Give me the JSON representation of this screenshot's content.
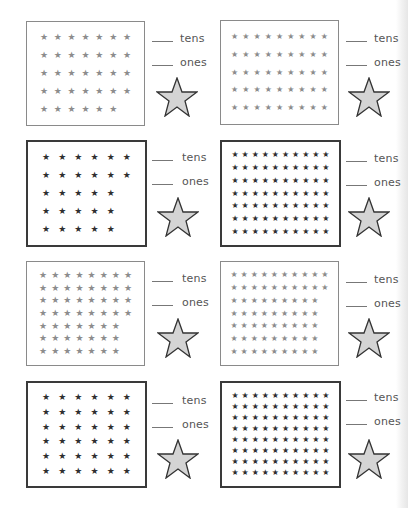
{
  "worksheet": {
    "labels": {
      "tens": "tens",
      "ones": "ones"
    },
    "star_glyph": "★",
    "colors": {
      "light_border": "#8a8a8a",
      "dark_border": "#3a3a3a",
      "light_star": "#8c8c8c",
      "dark_star": "#2e2e2e",
      "answer_star_fill": "#d4d4d4",
      "answer_star_stroke": "#333333"
    },
    "problems": [
      {
        "id": 1,
        "style": "light",
        "rows": [
          7,
          7,
          7,
          7,
          6
        ],
        "total": 34
      },
      {
        "id": 2,
        "style": "light",
        "rows": [
          9,
          9,
          9,
          9,
          9
        ],
        "total": 45
      },
      {
        "id": 3,
        "style": "dark",
        "rows": [
          6,
          6,
          5,
          5,
          5
        ],
        "total": 27
      },
      {
        "id": 4,
        "style": "dark",
        "rows": [
          10,
          10,
          10,
          10,
          10,
          10,
          10
        ],
        "total": 70
      },
      {
        "id": 5,
        "style": "light",
        "rows": [
          8,
          8,
          8,
          8,
          7,
          7,
          7
        ],
        "total": 53
      },
      {
        "id": 6,
        "style": "light",
        "rows": [
          10,
          10,
          9,
          9,
          9,
          9,
          9
        ],
        "total": 65
      },
      {
        "id": 7,
        "style": "dark",
        "rows": [
          6,
          6,
          6,
          6,
          6,
          6
        ],
        "total": 36
      },
      {
        "id": 8,
        "style": "dark",
        "rows": [
          10,
          10,
          10,
          10,
          10,
          10,
          10,
          10
        ],
        "total": 80
      }
    ]
  }
}
